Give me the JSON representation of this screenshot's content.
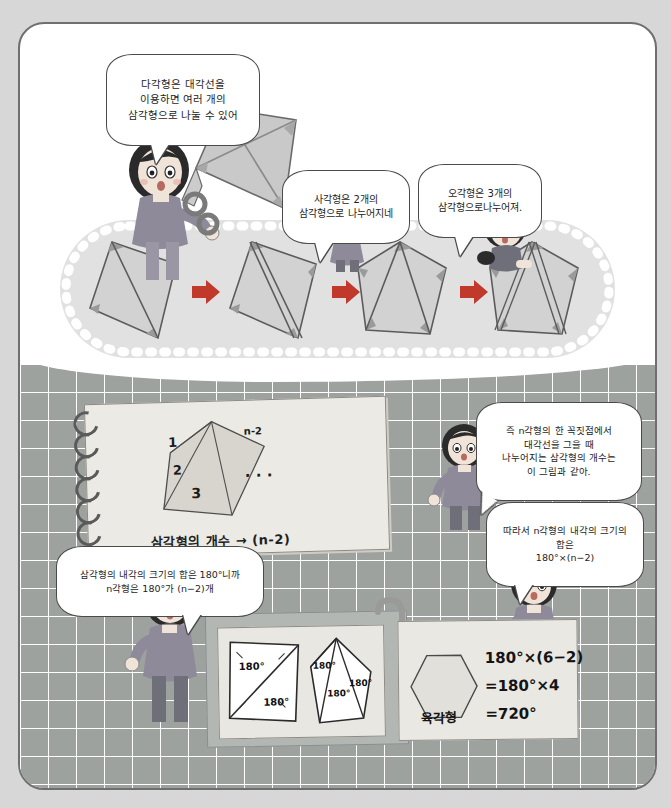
{
  "page": {
    "background_color": "#d7d7d7",
    "paper_color": "#ffffff",
    "border_color": "#6f6f6f",
    "grid_color": "#9a9f9c",
    "band_color": "#e1e1e1",
    "accent_red": "#c0392b"
  },
  "bubbles": {
    "kite_girl": "다각형은 대각선을\n이용하면 여러 개의\n삼각형으로 나눌 수 있어",
    "boy": "사각형은 2개의\n삼각형으로 나누어지네",
    "pigtail_girl": "오각형은 3개의\n삼각형으로나누어져.",
    "teacher_right": "즉 n각형의 한 꼭짓점에서\n대각선을 그을 때\n나누어지는 삼각형의 개수는\n이 그림과 같아.",
    "conclusion": "따라서 n각형의 내각의 크기의 합은\n180°×(n−2)",
    "left_girl": "삼각형의 내각의 크기의 합은 180°니까\nn각형은 180°가 (n−2)개"
  },
  "notebook": {
    "caption": "삼각형의 개수 → (n-2)",
    "labels": [
      "1",
      "2",
      "3",
      "n-2"
    ],
    "ellipsis": "· · ·"
  },
  "boards": {
    "left_board": {
      "quad_angles": [
        "180°",
        "180°"
      ],
      "penta_angles": [
        "180°",
        "180°",
        "180°"
      ]
    },
    "right_board": {
      "shape_label": "육각형",
      "lines": [
        "180°×(6−2)",
        "=180°×4",
        "=720°"
      ]
    }
  },
  "polygon_sequence": {
    "items": [
      {
        "name": "quadrilateral",
        "triangles": 1
      },
      {
        "name": "quadrilateral-split",
        "triangles": 2
      },
      {
        "name": "pentagon",
        "triangles": 1
      },
      {
        "name": "pentagon-split",
        "triangles": 3
      }
    ],
    "arrow_glyph": "➡"
  }
}
